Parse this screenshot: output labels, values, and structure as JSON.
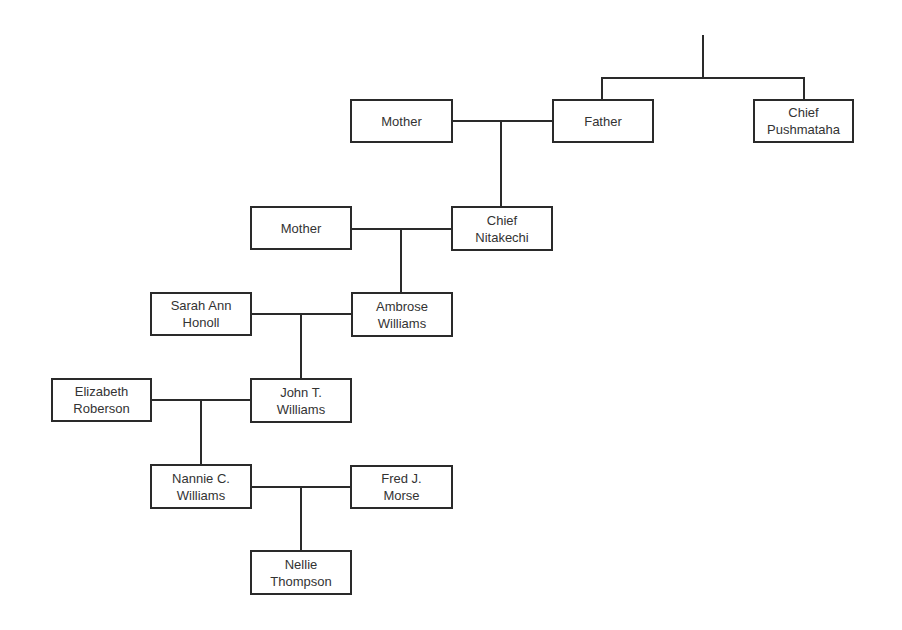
{
  "diagram": {
    "type": "family-tree",
    "nodes": [
      {
        "id": "mother-1",
        "label": "Mother",
        "x": 350,
        "y": 99,
        "w": 103,
        "h": 44
      },
      {
        "id": "father",
        "label": "Father",
        "x": 552,
        "y": 99,
        "w": 102,
        "h": 44
      },
      {
        "id": "chief-pushmataha",
        "label": "Chief\nPushmataha",
        "x": 753,
        "y": 99,
        "w": 101,
        "h": 44
      },
      {
        "id": "mother-2",
        "label": "Mother",
        "x": 250,
        "y": 206,
        "w": 102,
        "h": 44
      },
      {
        "id": "chief-nitakechi",
        "label": "Chief\nNitakechi",
        "x": 451,
        "y": 206,
        "w": 102,
        "h": 45
      },
      {
        "id": "sarah-ann-honoll",
        "label": "Sarah Ann\nHonoll",
        "x": 150,
        "y": 292,
        "w": 102,
        "h": 44
      },
      {
        "id": "ambrose-williams",
        "label": "Ambrose\nWilliams",
        "x": 351,
        "y": 292,
        "w": 102,
        "h": 45
      },
      {
        "id": "elizabeth-roberson",
        "label": "Elizabeth\nRoberson",
        "x": 51,
        "y": 378,
        "w": 101,
        "h": 44
      },
      {
        "id": "john-t-williams",
        "label": "John T.\nWilliams",
        "x": 250,
        "y": 378,
        "w": 102,
        "h": 45
      },
      {
        "id": "nannie-c-williams",
        "label": "Nannie C.\nWilliams",
        "x": 150,
        "y": 464,
        "w": 102,
        "h": 45
      },
      {
        "id": "fred-j-morse",
        "label": "Fred J.\nMorse",
        "x": 350,
        "y": 465,
        "w": 103,
        "h": 44
      },
      {
        "id": "nellie-thompson",
        "label": "Nellie\nThompson",
        "x": 250,
        "y": 550,
        "w": 102,
        "h": 45
      }
    ],
    "lines": [
      {
        "id": "root-stem",
        "kind": "v",
        "x": 702,
        "y": 35,
        "len": 44
      },
      {
        "id": "sibling-bar",
        "kind": "h",
        "x": 601,
        "y": 77,
        "len": 204
      },
      {
        "id": "father-drop",
        "kind": "v",
        "x": 601,
        "y": 77,
        "len": 23
      },
      {
        "id": "pushmataha-drop",
        "kind": "v",
        "x": 803,
        "y": 77,
        "len": 23
      },
      {
        "id": "marriage-1",
        "kind": "h",
        "x": 452,
        "y": 120,
        "len": 101
      },
      {
        "id": "child-1",
        "kind": "v",
        "x": 500,
        "y": 120,
        "len": 87
      },
      {
        "id": "marriage-2",
        "kind": "h",
        "x": 351,
        "y": 228,
        "len": 101
      },
      {
        "id": "child-2",
        "kind": "v",
        "x": 400,
        "y": 228,
        "len": 65
      },
      {
        "id": "marriage-3",
        "kind": "h",
        "x": 251,
        "y": 313,
        "len": 101
      },
      {
        "id": "child-3",
        "kind": "v",
        "x": 300,
        "y": 313,
        "len": 66
      },
      {
        "id": "marriage-4",
        "kind": "h",
        "x": 151,
        "y": 399,
        "len": 100
      },
      {
        "id": "child-4",
        "kind": "v",
        "x": 200,
        "y": 399,
        "len": 66
      },
      {
        "id": "marriage-5",
        "kind": "h",
        "x": 251,
        "y": 486,
        "len": 100
      },
      {
        "id": "child-5",
        "kind": "v",
        "x": 300,
        "y": 486,
        "len": 65
      }
    ]
  }
}
